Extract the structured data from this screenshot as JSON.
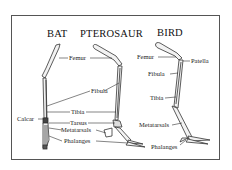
{
  "figure": {
    "titles": {
      "bat": "BAT",
      "pterosaur": "PTEROSAUR",
      "bird": "BIRD"
    },
    "labels": {
      "bat_calcar": "Calcar",
      "femur_left": "Femur",
      "fibula_left": "Fibula",
      "tibia_left": "Tibia",
      "tarsus": "Tarsus",
      "metatarsals_left": "Metatarsals",
      "phalanges_left": "Phalanges",
      "bird_femur": "Femur",
      "bird_patella": "Patella",
      "bird_fibula": "Fibula",
      "bird_tibia": "Tibia",
      "bird_metatarsals": "Metatarsals",
      "bird_phalanges": "Phalanges"
    },
    "colors": {
      "line": "#333333",
      "bone_fill": "#f2f2f2",
      "frame": "#555555",
      "background": "#ffffff"
    }
  }
}
